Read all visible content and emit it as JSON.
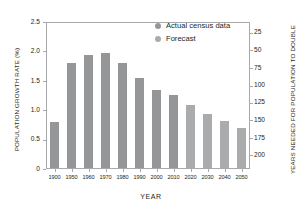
{
  "chart_data": {
    "type": "bar",
    "title": "",
    "xlabel": "YEAR",
    "ylabel": "POPULATION GROWTH RATE (%)",
    "ylabel_right": "YEARS NEEDED FOR POPULATION TO DOUBLE",
    "categories": [
      "1900",
      "1950",
      "1960",
      "1970",
      "1980",
      "1990",
      "2000",
      "2010",
      "2020",
      "2030",
      "2040",
      "2050"
    ],
    "values": [
      0.78,
      1.78,
      1.92,
      1.95,
      1.78,
      1.53,
      1.33,
      1.25,
      1.08,
      0.92,
      0.8,
      0.68
    ],
    "ylim": [
      0,
      2.5
    ],
    "yticks": [
      "0",
      "0.5",
      "1.0",
      "1.5",
      "2.0",
      "2.5"
    ],
    "ytick_values": [
      0,
      0.5,
      1.0,
      1.5,
      2.0,
      2.5
    ],
    "yticks_right": [
      "25",
      "50",
      "75",
      "100",
      "125",
      "150",
      "175",
      "200"
    ],
    "ytick_right_positions": [
      2.32,
      2.02,
      1.72,
      1.42,
      1.13,
      0.83,
      0.53,
      0.23
    ],
    "grid": false,
    "legend_position": "top-right",
    "legend": [
      {
        "label": "Actual census data",
        "color": "#949698"
      },
      {
        "label": "Forecast",
        "color": "#a9abad"
      }
    ],
    "bar_color": "#949698",
    "forecast_color": "#a9abad",
    "forecast_start_index": 8,
    "axis_color": "#a7a9ac"
  }
}
